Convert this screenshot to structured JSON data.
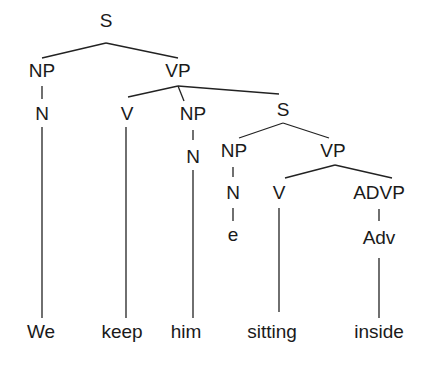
{
  "diagram": {
    "type": "syntax-tree",
    "nodes": [
      {
        "id": "S1",
        "label": "S",
        "x": 106,
        "y": 27
      },
      {
        "id": "NP1",
        "label": "NP",
        "x": 42,
        "y": 77
      },
      {
        "id": "VP1",
        "label": "VP",
        "x": 178,
        "y": 77
      },
      {
        "id": "N1",
        "label": "N",
        "x": 42,
        "y": 120
      },
      {
        "id": "V1",
        "label": "V",
        "x": 127,
        "y": 120
      },
      {
        "id": "NP2",
        "label": "NP",
        "x": 193,
        "y": 120
      },
      {
        "id": "N2",
        "label": "N",
        "x": 193,
        "y": 163
      },
      {
        "id": "S2",
        "label": "S",
        "x": 283,
        "y": 116
      },
      {
        "id": "NP3",
        "label": "NP",
        "x": 234,
        "y": 157
      },
      {
        "id": "VP3",
        "label": "VP",
        "x": 333,
        "y": 157
      },
      {
        "id": "N3",
        "label": "N",
        "x": 233,
        "y": 199
      },
      {
        "id": "V3",
        "label": "V",
        "x": 279,
        "y": 199
      },
      {
        "id": "ADVP",
        "label": "ADVP",
        "x": 379,
        "y": 199
      },
      {
        "id": "e",
        "label": "e",
        "x": 233,
        "y": 241
      },
      {
        "id": "Adv",
        "label": "Adv",
        "x": 379,
        "y": 244
      },
      {
        "id": "We",
        "label": "We",
        "x": 41,
        "y": 338
      },
      {
        "id": "keep",
        "label": "keep",
        "x": 122,
        "y": 338
      },
      {
        "id": "him",
        "label": "him",
        "x": 186,
        "y": 338
      },
      {
        "id": "sitting",
        "label": "sitting",
        "x": 272,
        "y": 338
      },
      {
        "id": "inside",
        "label": "inside",
        "x": 379,
        "y": 338
      }
    ],
    "edges": [
      {
        "from": "S1",
        "to": "NP1",
        "x1": 106,
        "y1": 43,
        "x2": 42,
        "y2": 58
      },
      {
        "from": "S1",
        "to": "VP1",
        "x1": 106,
        "y1": 43,
        "x2": 178,
        "y2": 58
      },
      {
        "from": "NP1",
        "to": "N1",
        "x1": 42,
        "y1": 86,
        "x2": 42,
        "y2": 99
      },
      {
        "from": "N1",
        "to": "We",
        "x1": 42,
        "y1": 127,
        "x2": 42,
        "y2": 318
      },
      {
        "from": "VP1",
        "to": "V1",
        "x1": 178,
        "y1": 86,
        "x2": 128,
        "y2": 97
      },
      {
        "from": "VP1",
        "to": "NP2",
        "x1": 178,
        "y1": 86,
        "x2": 184,
        "y2": 101
      },
      {
        "from": "VP1",
        "to": "S2",
        "x1": 178,
        "y1": 86,
        "x2": 279,
        "y2": 94
      },
      {
        "from": "V1",
        "to": "keep",
        "x1": 126,
        "y1": 127,
        "x2": 126,
        "y2": 318
      },
      {
        "from": "NP2",
        "to": "N2",
        "x1": 193,
        "y1": 130,
        "x2": 193,
        "y2": 140
      },
      {
        "from": "N2",
        "to": "him",
        "x1": 193,
        "y1": 170,
        "x2": 193,
        "y2": 318
      },
      {
        "from": "S2",
        "to": "NP3",
        "x1": 283,
        "y1": 123,
        "x2": 239,
        "y2": 138
      },
      {
        "from": "S2",
        "to": "VP3",
        "x1": 283,
        "y1": 123,
        "x2": 329,
        "y2": 138
      },
      {
        "from": "NP3",
        "to": "N3",
        "x1": 233,
        "y1": 167,
        "x2": 233,
        "y2": 177
      },
      {
        "from": "N3",
        "to": "e",
        "x1": 233,
        "y1": 208,
        "x2": 233,
        "y2": 221
      },
      {
        "from": "VP3",
        "to": "V3",
        "x1": 335,
        "y1": 165,
        "x2": 285,
        "y2": 178
      },
      {
        "from": "VP3",
        "to": "ADVP",
        "x1": 335,
        "y1": 165,
        "x2": 392,
        "y2": 178
      },
      {
        "from": "V3",
        "to": "sitting",
        "x1": 279,
        "y1": 208,
        "x2": 279,
        "y2": 312
      },
      {
        "from": "ADVP",
        "to": "Adv",
        "x1": 379,
        "y1": 209,
        "x2": 379,
        "y2": 221
      },
      {
        "from": "Adv",
        "to": "inside",
        "x1": 379,
        "y1": 258,
        "x2": 379,
        "y2": 318
      }
    ]
  }
}
